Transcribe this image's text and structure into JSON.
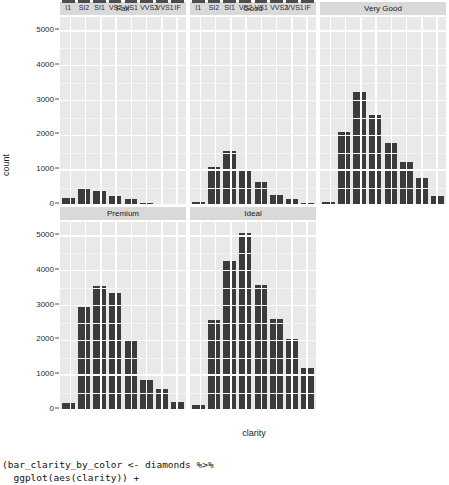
{
  "chart_data": {
    "type": "bar",
    "title": "",
    "xlabel": "clarity",
    "ylabel": "count",
    "ylim": [
      0,
      5400
    ],
    "yticks": [
      0,
      1000,
      2000,
      3000,
      4000,
      5000
    ],
    "ytick_labels": [
      "0",
      "1000",
      "2000",
      "3000",
      "4000",
      "5000"
    ],
    "grid": true,
    "legend": "none",
    "facet_variable": "cut",
    "categories": [
      "I1",
      "SI2",
      "SI1",
      "VS2",
      "VS1",
      "VVS2",
      "VVS1",
      "IF"
    ],
    "panels": [
      {
        "label": "Fair",
        "values": [
          210,
          466,
          408,
          261,
          170,
          69,
          17,
          9
        ]
      },
      {
        "label": "Good",
        "values": [
          96,
          1081,
          1560,
          978,
          648,
          286,
          186,
          71
        ]
      },
      {
        "label": "Very Good",
        "values": [
          84,
          2100,
          3240,
          2591,
          1775,
          1235,
          789,
          268
        ]
      },
      {
        "label": "Premium",
        "values": [
          205,
          2949,
          3575,
          3357,
          1989,
          870,
          616,
          230
        ]
      },
      {
        "label": "Ideal",
        "values": [
          146,
          2598,
          4282,
          5071,
          3589,
          2606,
          2047,
          1212
        ]
      }
    ]
  },
  "colors": {
    "bar": "#3b3b3b",
    "panel_background": "#e9e9e9",
    "strip_background": "#d9d9d9",
    "gridline_major": "#ffffff",
    "page_background": "#ffffff",
    "text": "#1a1a1a"
  },
  "code": {
    "line1": "(bar_clarity_by_color <- diamonds %>%",
    "line2": "  ggplot(aes(clarity)) +"
  }
}
